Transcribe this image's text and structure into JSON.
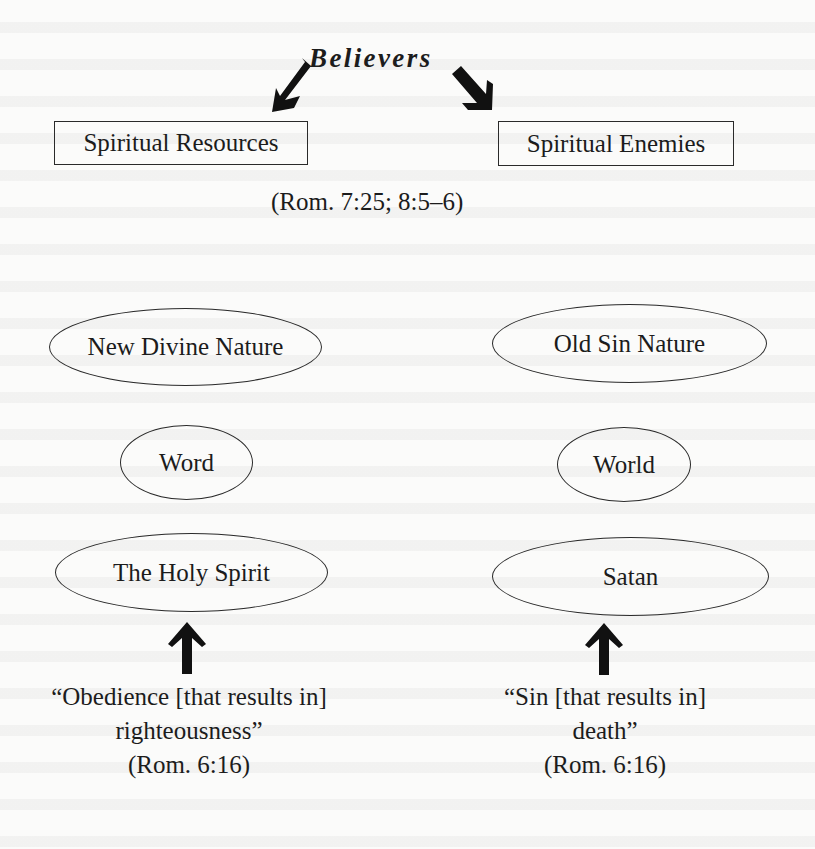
{
  "diagram": {
    "title": "Believers",
    "left_header": "Spiritual Resources",
    "right_header": "Spiritual Enemies",
    "header_reference": "(Rom. 7:25; 8:5–6)",
    "left_column": [
      {
        "label": "New Divine Nature"
      },
      {
        "label": "Word"
      },
      {
        "label": "The Holy Spirit"
      }
    ],
    "right_column": [
      {
        "label": "Old Sin Nature"
      },
      {
        "label": "World"
      },
      {
        "label": "Satan"
      }
    ],
    "left_caption": {
      "line1": "“Obedience [that results in]",
      "line2": "righteousness”",
      "reference": "(Rom. 6:16)"
    },
    "right_caption": {
      "line1": "“Sin [that results in]",
      "line2": "death”",
      "reference": "(Rom. 6:16)"
    },
    "arrows": {
      "title_to_left": "arrow-down-left-icon",
      "title_to_right": "arrow-down-right-icon",
      "left_caption_up": "arrow-up-icon",
      "right_caption_up": "arrow-up-icon"
    },
    "colors": {
      "ink": "#1c1c1c",
      "paper": "#fbfbfa"
    }
  }
}
